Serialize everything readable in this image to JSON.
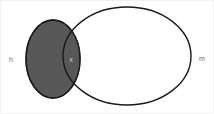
{
  "diagram": {
    "type": "venn",
    "background_color": "#ffffff",
    "stroke_color": "#1a1a1a",
    "sets": [
      {
        "id": "h",
        "label": "h",
        "label_color": "#6e6e6e",
        "fill": "#585858",
        "filled": true,
        "shape": "ellipse",
        "cx": 52,
        "cy": 58,
        "rx": 27,
        "ry": 39
      },
      {
        "id": "m",
        "label": "m",
        "label_color": "#6e6e6e",
        "fill": "#ffffff",
        "filled": false,
        "shape": "ellipse",
        "cx": 126,
        "cy": 55,
        "rx": 64,
        "ry": 49
      }
    ],
    "intersection": {
      "label": "x",
      "label_color": "#d6d6d6",
      "fill": "#585858",
      "cx": 70,
      "cy": 57
    },
    "labels": {
      "left": "h",
      "center": "x",
      "right": "m"
    },
    "label_positions": {
      "left": {
        "x": 10,
        "y": 59
      },
      "center": {
        "x": 70,
        "y": 59
      },
      "right": {
        "x": 201,
        "y": 58
      }
    }
  }
}
